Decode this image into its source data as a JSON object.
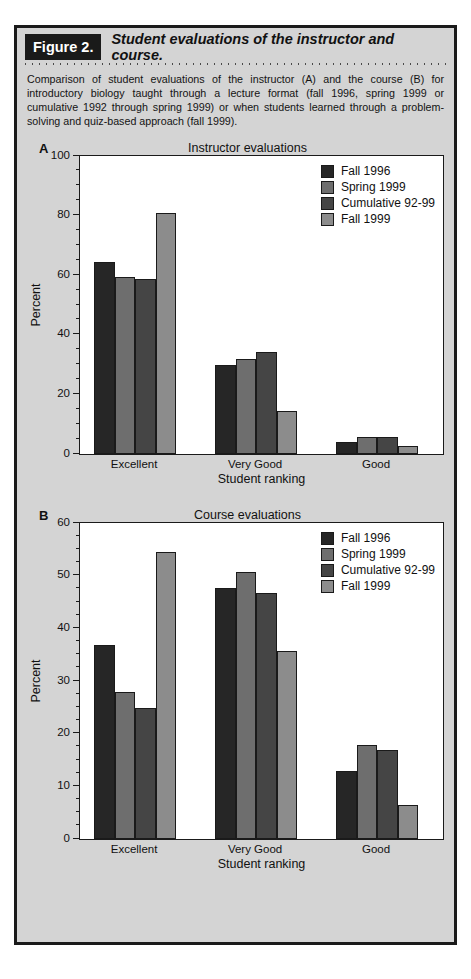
{
  "figure": {
    "number_label": "Figure 2.",
    "title": "Student evaluations of the instructor and course.",
    "caption": "Comparison of student evaluations of the instructor (A) and the course (B) for introductory biology taught through a lecture format (fall 1996, spring 1999 or cumulative 1992 through spring 1999) or when students learned through a problem-solving and quiz-based approach (fall 1999)."
  },
  "colors": {
    "series_fall_1996": "#262626",
    "series_spring_1999": "#6e6e6e",
    "series_cumulative_92_99": "#454545",
    "series_fall_1999": "#8c8c8c",
    "panel_background": "#d4d4d4",
    "plot_background": "#ffffff",
    "axis": "#1a1a1a",
    "figure_number_background": "#1a1a1a"
  },
  "panels": {
    "a": {
      "letter": "A"
    },
    "b": {
      "letter": "B"
    }
  },
  "chart_data": [
    {
      "id": "instructor-evaluations",
      "type": "bar",
      "title": "Instructor evaluations",
      "xlabel": "Student ranking",
      "ylabel": "Percent",
      "categories": [
        "Excellent",
        "Very Good",
        "Good"
      ],
      "ylim": [
        0,
        100
      ],
      "yticks": [
        0,
        20,
        40,
        60,
        80,
        100
      ],
      "ytick_labels": [
        "0",
        "20",
        "40",
        "60",
        "80",
        "100"
      ],
      "minor_tick_interval": 5,
      "grid": false,
      "legend_position": "top-right",
      "series": [
        {
          "name": "Fall 1996",
          "color": "#262626",
          "values": [
            65,
            30,
            4
          ]
        },
        {
          "name": "Spring 1999",
          "color": "#6e6e6e",
          "values": [
            60,
            32,
            5.5
          ]
        },
        {
          "name": "Cumulative 92-99",
          "color": "#454545",
          "values": [
            59,
            34.5,
            5.5
          ]
        },
        {
          "name": "Fall 1999",
          "color": "#8c8c8c",
          "values": [
            81.5,
            14.5,
            2.5
          ]
        }
      ]
    },
    {
      "id": "course-evaluations",
      "type": "bar",
      "title": "Course evaluations",
      "xlabel": "Student ranking",
      "ylabel": "Percent",
      "categories": [
        "Excellent",
        "Very Good",
        "Good"
      ],
      "ylim": [
        0,
        60
      ],
      "yticks": [
        0,
        10,
        20,
        30,
        40,
        50,
        60
      ],
      "ytick_labels": [
        "0",
        "10",
        "20",
        "30",
        "40",
        "50",
        "60"
      ],
      "minor_tick_interval": 2.5,
      "grid": false,
      "legend_position": "top-right",
      "series": [
        {
          "name": "Fall 1996",
          "color": "#262626",
          "values": [
            37,
            48,
            13
          ]
        },
        {
          "name": "Spring 1999",
          "color": "#6e6e6e",
          "values": [
            28,
            51,
            18
          ]
        },
        {
          "name": "Cumulative 92-99",
          "color": "#454545",
          "values": [
            25,
            47,
            17
          ]
        },
        {
          "name": "Fall 1999",
          "color": "#8c8c8c",
          "values": [
            55,
            36,
            6.5
          ]
        }
      ]
    }
  ]
}
